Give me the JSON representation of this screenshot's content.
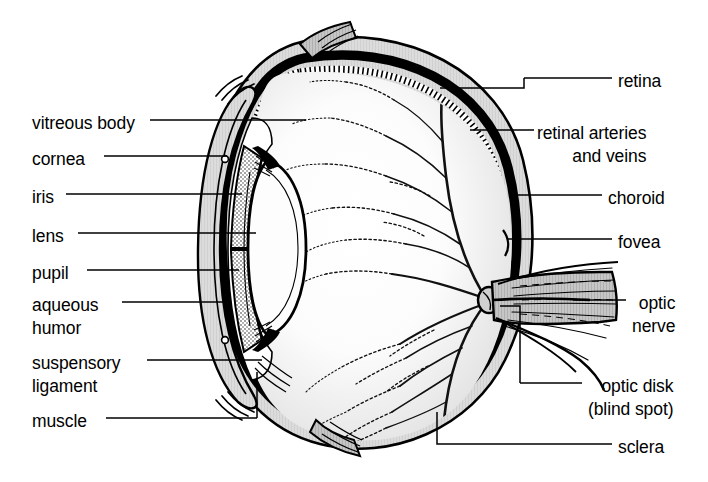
{
  "figure": {
    "background_color": "#ffffff",
    "ink_color": "#000000",
    "sclera_fill": "#d8d8d8",
    "vitreous_fill": "#fbfbfb",
    "choroid_fill": "#000000",
    "retina_fill": "#ffffff"
  },
  "labels_left": [
    {
      "key": "vitreous_body",
      "text": "vitreous body",
      "x": 32,
      "y": 112,
      "leader_x1": 150,
      "leader_x2": 306,
      "leader_y": 120
    },
    {
      "key": "cornea",
      "text": "cornea",
      "x": 32,
      "y": 148,
      "leader_x1": 104,
      "leader_x2": 227,
      "leader_y": 156
    },
    {
      "key": "iris",
      "text": "iris",
      "x": 32,
      "y": 186,
      "leader_x1": 66,
      "leader_x2": 242,
      "leader_y": 194
    },
    {
      "key": "lens",
      "text": "lens",
      "x": 32,
      "y": 225,
      "leader_x1": 78,
      "leader_x2": 256,
      "leader_y": 233
    },
    {
      "key": "pupil",
      "text": "pupil",
      "x": 32,
      "y": 262,
      "leader_x1": 87,
      "leader_x2": 239,
      "leader_y": 270
    },
    {
      "key": "aqueous_humor",
      "text": "aqueous\nhumor",
      "x": 32,
      "y": 294,
      "leader_x1": 122,
      "leader_x2": 229,
      "leader_y": 302
    },
    {
      "key": "suspensory_ligament",
      "text": "suspensory\nligament",
      "x": 32,
      "y": 352,
      "leader_x1": 147,
      "leader_x2": 262,
      "leader_y": 360
    },
    {
      "key": "muscle",
      "text": "muscle",
      "x": 32,
      "y": 410,
      "leader_x1": 106,
      "leader_x2": 257,
      "leader_y": 418
    }
  ],
  "labels_right": [
    {
      "key": "retina",
      "text": "retina",
      "x": 618,
      "y": 70,
      "leader_x1": 524,
      "leader_x2": 612,
      "leader_y": 78
    },
    {
      "key": "retinal_arteries",
      "text": "retinal arteries\nand veins",
      "x": 537,
      "y": 122,
      "leader_x1": 520,
      "leader_x2": 534,
      "leader_y": 130
    },
    {
      "key": "choroid",
      "text": "choroid",
      "x": 608,
      "y": 187,
      "leader_x1": 528,
      "leader_x2": 602,
      "leader_y": 195
    },
    {
      "key": "fovea",
      "text": "fovea",
      "x": 618,
      "y": 231,
      "leader_x1": 540,
      "leader_x2": 612,
      "leader_y": 239
    },
    {
      "key": "optic_nerve",
      "text": "optic\nnerve",
      "x": 632,
      "y": 292,
      "leader_x1": 573,
      "leader_x2": 626,
      "leader_y": 300
    },
    {
      "key": "optic_disk",
      "text": "optic disk\n(blind spot)",
      "x": 588,
      "y": 375,
      "leader_x1": 520,
      "leader_x2": 582,
      "leader_y": 383
    },
    {
      "key": "sclera",
      "text": "sclera",
      "x": 618,
      "y": 436,
      "leader_x1": 519,
      "leader_x2": 612,
      "leader_y": 444
    }
  ]
}
